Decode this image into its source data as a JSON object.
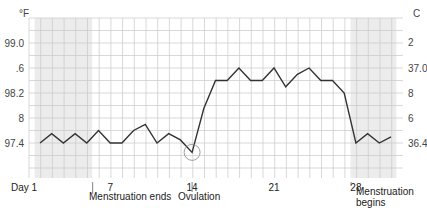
{
  "chart_data": {
    "type": "line",
    "title": "",
    "xlabel": "Day",
    "ylabel": "°F",
    "ylabel_right": "C",
    "x": [
      1,
      2,
      3,
      4,
      5,
      6,
      7,
      8,
      9,
      10,
      11,
      12,
      13,
      14,
      15,
      16,
      17,
      18,
      19,
      20,
      21,
      22,
      23,
      24,
      25,
      26,
      27,
      28,
      29,
      30,
      31
    ],
    "series": [
      {
        "name": "Basal body temperature (°F)",
        "values": [
          97.4,
          97.55,
          97.4,
          97.55,
          97.4,
          97.6,
          97.4,
          97.4,
          97.6,
          97.7,
          97.4,
          97.55,
          97.45,
          97.25,
          97.95,
          98.4,
          98.4,
          98.6,
          98.4,
          98.4,
          98.6,
          98.3,
          98.5,
          98.6,
          98.4,
          98.4,
          98.2,
          97.4,
          97.55,
          97.4,
          97.5
        ]
      }
    ],
    "x_ticks": [
      {
        "value": 1,
        "label": "Day 1"
      },
      {
        "value": 7,
        "label": "7"
      },
      {
        "value": 14,
        "label": "14"
      },
      {
        "value": 21,
        "label": "21"
      },
      {
        "value": 28,
        "label": "28"
      }
    ],
    "y_ticks_left": [
      {
        "value": 99.0,
        "label": "99.0"
      },
      {
        "value": 98.6,
        "label": ".6"
      },
      {
        "value": 98.2,
        "label": "98.2"
      },
      {
        "value": 97.8,
        "label": "8"
      },
      {
        "value": 97.4,
        "label": "97.4"
      }
    ],
    "y_ticks_right": [
      {
        "value": 37.2,
        "label": "2"
      },
      {
        "value": 37.0,
        "label": "37.0"
      },
      {
        "value": 36.8,
        "label": "8"
      },
      {
        "value": 36.6,
        "label": "6"
      },
      {
        "value": 36.4,
        "label": "36.4"
      }
    ],
    "ylim": [
      97.0,
      99.4
    ],
    "shaded_regions": [
      {
        "from_day": 1,
        "to_day": 5,
        "meaning": "menstruation"
      },
      {
        "from_day": 28,
        "to_day": 31,
        "meaning": "menstruation"
      }
    ],
    "annotations": [
      {
        "day": 5,
        "text": "Menstruation ends"
      },
      {
        "day": 14,
        "text": "Ovulation",
        "marker": "circle"
      },
      {
        "day": 28,
        "text": "Menstruation begins"
      }
    ],
    "grid": true,
    "legend": "none"
  },
  "labels": {
    "unit_left": "°F",
    "unit_right": "C",
    "menstruation_ends": "Menstruation ends",
    "ovulation": "Ovulation",
    "menstruation_begins_1": "Menstruation",
    "menstruation_begins_2": "begins"
  },
  "colors": {
    "line": "#333333",
    "grid": "#c8c8c8",
    "shade": "#ececec",
    "text": "#444444"
  }
}
